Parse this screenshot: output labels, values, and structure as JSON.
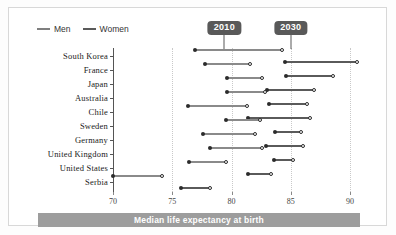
{
  "legend": {
    "items": [
      {
        "label": "Men",
        "color": "#7f7f7f",
        "icon": "line-swatch-icon"
      },
      {
        "label": "Women",
        "color": "#5a5a5a",
        "icon": "line-swatch-icon"
      }
    ]
  },
  "badges": [
    {
      "label": "2010",
      "value": 2010,
      "x_value": 79.4
    },
    {
      "label": "2030",
      "value": 2030,
      "x_value": 85.0
    }
  ],
  "footer": {
    "caption": "Median life expectancy at birth"
  },
  "axis": {
    "ticks": [
      "70",
      "75",
      "80",
      "85",
      "90"
    ],
    "tick_values": [
      70,
      75,
      80,
      85,
      90
    ],
    "min": 70,
    "max": 91
  },
  "chart_data": {
    "type": "dumbbell",
    "title": "",
    "subtitle": "",
    "xlabel": "Median life expectancy at birth",
    "ylabel": "",
    "xlim": [
      70,
      91
    ],
    "grid": true,
    "legend_position": "top-left",
    "annotations": [
      "2010",
      "2030"
    ],
    "categories": [
      "South Korea",
      "France",
      "Japan",
      "Australia",
      "Chile",
      "Sweden",
      "Germany",
      "United Kingdom",
      "United States",
      "Serbia"
    ],
    "series": [
      {
        "name": "Men 2010",
        "values": [
          76.9,
          77.8,
          79.6,
          79.6,
          76.3,
          79.5,
          77.6,
          78.2,
          76.4,
          70.0
        ]
      },
      {
        "name": "Women 2010",
        "values": [
          84.3,
          81.6,
          82.6,
          82.8,
          81.3,
          82.4,
          82.0,
          82.6,
          79.5,
          74.1
        ]
      },
      {
        "name": "Men 2030",
        "values": [
          84.5,
          84.6,
          83.0,
          83.2,
          81.4,
          83.7,
          82.9,
          83.6,
          81.4,
          75.7
        ]
      },
      {
        "name": "Women 2030",
        "values": [
          90.6,
          88.6,
          87.0,
          86.4,
          86.6,
          85.9,
          86.0,
          85.2,
          83.3,
          78.2
        ]
      }
    ],
    "rows": [
      {
        "category": "South Korea",
        "men_2010": 76.9,
        "women_2010": 84.3,
        "men_2030": 84.5,
        "women_2030": 90.6
      },
      {
        "category": "France",
        "men_2010": 77.8,
        "women_2010": 81.6,
        "men_2030": 84.6,
        "women_2030": 88.6
      },
      {
        "category": "Japan",
        "men_2010": 79.6,
        "women_2010": 82.6,
        "men_2030": 83.0,
        "women_2030": 87.0
      },
      {
        "category": "Australia",
        "men_2010": 79.6,
        "women_2010": 82.8,
        "men_2030": 83.2,
        "women_2030": 86.4
      },
      {
        "category": "Chile",
        "men_2010": 76.3,
        "women_2010": 81.3,
        "men_2030": 81.4,
        "women_2030": 86.6
      },
      {
        "category": "Sweden",
        "men_2010": 79.5,
        "women_2010": 82.4,
        "men_2030": 83.7,
        "women_2030": 85.9
      },
      {
        "category": "Germany",
        "men_2010": 77.6,
        "women_2010": 82.0,
        "men_2030": 82.9,
        "women_2030": 86.0
      },
      {
        "category": "United Kingdom",
        "men_2010": 78.2,
        "women_2010": 82.6,
        "men_2030": 83.6,
        "women_2030": 85.2
      },
      {
        "category": "United States",
        "men_2010": 76.4,
        "women_2010": 79.5,
        "men_2030": 81.4,
        "women_2030": 83.3
      },
      {
        "category": "Serbia",
        "men_2010": 70.0,
        "women_2010": 74.1,
        "men_2030": 75.7,
        "women_2030": 78.2
      }
    ],
    "colors": {
      "men_line": "#8a8a8a",
      "women_line": "#5a5a5a",
      "dot_fill": "#2b2b2b",
      "dot_open_border": "#2b2b2b",
      "grid": "#c9c9c9",
      "axis": "#555555",
      "badge_bg": "#595959",
      "footer_bg": "#9d9d9d"
    }
  }
}
